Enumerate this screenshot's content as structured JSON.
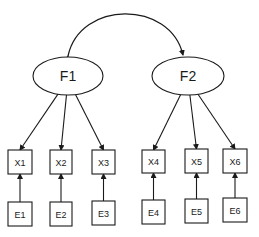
{
  "diagram": {
    "type": "confirmatory-factor-model",
    "stroke_color": "#1a1a1a",
    "background": "#ffffff",
    "factors": [
      {
        "id": "F1",
        "label": "F1",
        "cx": 68,
        "cy": 76,
        "rx": 35,
        "ry": 19
      },
      {
        "id": "F2",
        "label": "F2",
        "cx": 188,
        "cy": 76,
        "rx": 36,
        "ry": 19
      }
    ],
    "covariance": {
      "from": "F1",
      "to": "F2",
      "bidirectional": true
    },
    "indicators": [
      {
        "id": "X1",
        "label": "X1",
        "factor": "F1",
        "x": 8,
        "y": 150,
        "w": 24,
        "h": 24
      },
      {
        "id": "X2",
        "label": "X2",
        "factor": "F1",
        "x": 50,
        "y": 150,
        "w": 22,
        "h": 24
      },
      {
        "id": "X3",
        "label": "X3",
        "factor": "F1",
        "x": 92,
        "y": 150,
        "w": 23,
        "h": 24
      },
      {
        "id": "X4",
        "label": "X4",
        "factor": "F2",
        "x": 142,
        "y": 150,
        "w": 23,
        "h": 23
      },
      {
        "id": "X5",
        "label": "X5",
        "factor": "F2",
        "x": 185,
        "y": 149,
        "w": 23,
        "h": 24
      },
      {
        "id": "X6",
        "label": "X6",
        "factor": "F2",
        "x": 223,
        "y": 149,
        "w": 24,
        "h": 24
      }
    ],
    "errors": [
      {
        "id": "E1",
        "label": "E1",
        "target": "X1",
        "x": 8,
        "y": 202,
        "w": 24,
        "h": 24
      },
      {
        "id": "E2",
        "label": "E2",
        "target": "X2",
        "x": 50,
        "y": 202,
        "w": 22,
        "h": 24
      },
      {
        "id": "E3",
        "label": "E3",
        "target": "X3",
        "x": 92,
        "y": 201,
        "w": 23,
        "h": 24
      },
      {
        "id": "E4",
        "label": "E4",
        "target": "X4",
        "x": 142,
        "y": 200,
        "w": 23,
        "h": 24
      },
      {
        "id": "E5",
        "label": "E5",
        "target": "X5",
        "x": 185,
        "y": 199,
        "w": 23,
        "h": 24
      },
      {
        "id": "E6",
        "label": "E6",
        "target": "X6",
        "x": 223,
        "y": 198,
        "w": 24,
        "h": 24
      }
    ]
  }
}
